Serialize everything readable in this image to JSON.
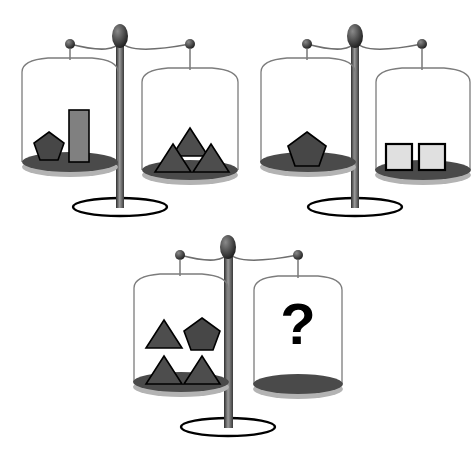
{
  "puzzle": {
    "title": "Balance scale equivalence puzzle",
    "type": "balance-scale-logic-puzzle",
    "unknown_marker": "?",
    "background_color": "#ffffff"
  },
  "palette": {
    "shape_fill_dark": "#4d4d4d",
    "shape_fill_pentagon": "#474747",
    "shape_fill_bar": "#808080",
    "shape_fill_square": "#e0e0e0",
    "shape_stroke": "#000000",
    "pan_dish_fill": "#4a4a4a",
    "pan_shadow_fill": "#b3b3b3",
    "post_dark": "#3a3a3a",
    "post_light": "#8f8f8f",
    "wire_stroke": "#6e6e6e",
    "knob_fill": "#333333",
    "base_stroke": "#000000",
    "qmark_color": "#000000"
  },
  "scales": [
    {
      "id": "scale-1",
      "name": "scale-one",
      "state": "balanced",
      "left_pan": {
        "name": "left-pan",
        "items": [
          {
            "shape": "pentagon",
            "count": 1,
            "fill": "#474747",
            "label": "pentagon"
          },
          {
            "shape": "bar",
            "count": 1,
            "fill": "#808080",
            "label": "tall bar"
          }
        ]
      },
      "right_pan": {
        "name": "right-pan",
        "items": [
          {
            "shape": "triangle",
            "count": 3,
            "fill": "#4d4d4d",
            "label": "triangle"
          }
        ]
      }
    },
    {
      "id": "scale-2",
      "name": "scale-two",
      "state": "balanced",
      "left_pan": {
        "name": "left-pan",
        "items": [
          {
            "shape": "pentagon",
            "count": 1,
            "fill": "#474747",
            "label": "pentagon"
          }
        ]
      },
      "right_pan": {
        "name": "right-pan",
        "items": [
          {
            "shape": "square",
            "count": 2,
            "fill": "#e0e0e0",
            "label": "square"
          }
        ]
      }
    },
    {
      "id": "scale-3",
      "name": "scale-three",
      "state": "balanced",
      "left_pan": {
        "name": "left-pan",
        "items": [
          {
            "shape": "triangle",
            "count": 3,
            "fill": "#4d4d4d",
            "label": "triangle"
          },
          {
            "shape": "pentagon",
            "count": 1,
            "fill": "#474747",
            "label": "pentagon"
          }
        ]
      },
      "right_pan": {
        "name": "right-pan",
        "unknown": true,
        "unknown_text": "?",
        "items": []
      }
    }
  ]
}
